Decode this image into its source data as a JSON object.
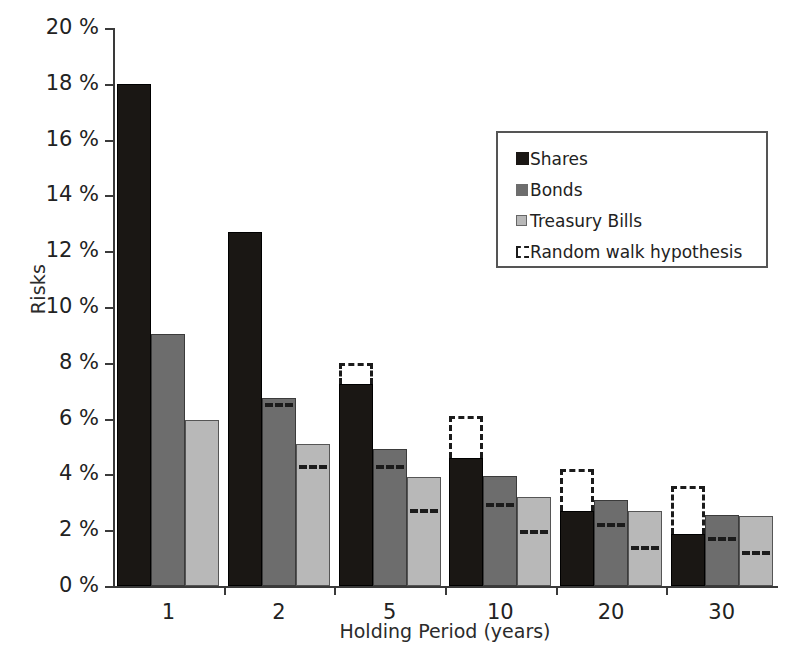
{
  "chart_data": {
    "type": "bar",
    "title": "",
    "xlabel": "Holding Period (years)",
    "ylabel": "Risks",
    "categories": [
      "1",
      "2",
      "5",
      "10",
      "20",
      "30"
    ],
    "ylim": [
      0,
      20
    ],
    "ytick_values": [
      0,
      2,
      4,
      6,
      8,
      10,
      12,
      14,
      16,
      18,
      20
    ],
    "ytick_labels": [
      "0 %",
      "2 %",
      "4 %",
      "6 %",
      "8 %",
      "10 %",
      "12 %",
      "14 %",
      "16 %",
      "18 %",
      "20 %"
    ],
    "grid": false,
    "legend_position": "upper right",
    "series": [
      {
        "name": "Shares",
        "color": "#1a1714",
        "values": [
          18.0,
          12.7,
          7.25,
          4.6,
          2.7,
          1.85
        ]
      },
      {
        "name": "Bonds",
        "color": "#6d6d6d",
        "values": [
          9.05,
          6.75,
          4.9,
          3.95,
          3.1,
          2.55
        ]
      },
      {
        "name": "Treasury Bills",
        "color": "#b8b8b8",
        "values": [
          5.95,
          5.1,
          3.9,
          3.2,
          2.7,
          2.5
        ]
      }
    ],
    "random_walk": {
      "name": "Random walk hypothesis",
      "style": "dashed",
      "color": "#1b1b1b",
      "values": {
        "Shares": [
          null,
          null,
          8.0,
          6.1,
          4.2,
          3.6
        ],
        "Bonds": [
          null,
          6.4,
          4.2,
          2.85,
          2.1,
          1.6
        ],
        "Treasury Bills": [
          null,
          4.2,
          2.6,
          1.85,
          1.3,
          1.1
        ]
      }
    }
  },
  "legend": {
    "items": [
      {
        "label": "Shares"
      },
      {
        "label": "Bonds"
      },
      {
        "label": "Treasury Bills"
      },
      {
        "label": "Random walk hypothesis"
      }
    ]
  }
}
